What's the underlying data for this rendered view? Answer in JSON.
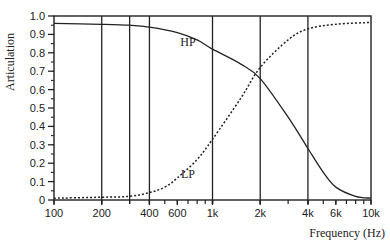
{
  "chart_data": {
    "type": "line",
    "title": "",
    "xlabel": "Frequency (Hz)",
    "ylabel": "Articulation",
    "xscale": "log",
    "xlim": [
      100,
      10000
    ],
    "ylim": [
      0,
      1.0
    ],
    "grid": "vertical lines at 200, 300, 400, 1k, 2k, 4k",
    "y_ticks": [
      "0",
      "0.1",
      "0.2",
      "0.3",
      "0.4",
      "0.5",
      "0.6",
      "0.7",
      "0.8",
      "0.9",
      "1.0"
    ],
    "x_ticks": [
      {
        "value": 100,
        "label": "100"
      },
      {
        "value": 200,
        "label": "200"
      },
      {
        "value": 400,
        "label": "400"
      },
      {
        "value": 600,
        "label": "600"
      },
      {
        "value": 1000,
        "label": "1k"
      },
      {
        "value": 2000,
        "label": "2k"
      },
      {
        "value": 4000,
        "label": "4k"
      },
      {
        "value": 6000,
        "label": "6k"
      },
      {
        "value": 10000,
        "label": "10k"
      }
    ],
    "vertical_lines": [
      200,
      300,
      400,
      1000,
      2000,
      4000
    ],
    "series": [
      {
        "name": "HP",
        "style": "solid",
        "x": [
          100,
          200,
          300,
          400,
          600,
          800,
          1000,
          1500,
          2000,
          3000,
          4000,
          5000,
          6000,
          8000,
          10000
        ],
        "y": [
          0.96,
          0.955,
          0.95,
          0.94,
          0.91,
          0.87,
          0.82,
          0.74,
          0.66,
          0.45,
          0.28,
          0.15,
          0.07,
          0.02,
          0.01
        ]
      },
      {
        "name": "LP",
        "style": "dotted",
        "x": [
          100,
          200,
          300,
          400,
          500,
          600,
          800,
          1000,
          1500,
          2000,
          3000,
          4000,
          6000,
          10000
        ],
        "y": [
          0.01,
          0.015,
          0.02,
          0.04,
          0.07,
          0.12,
          0.22,
          0.33,
          0.55,
          0.72,
          0.87,
          0.93,
          0.955,
          0.965
        ]
      }
    ],
    "annotations": [
      {
        "text": "HP",
        "x": 700,
        "y": 0.86
      },
      {
        "text": "LP",
        "x": 700,
        "y": 0.14
      }
    ]
  }
}
